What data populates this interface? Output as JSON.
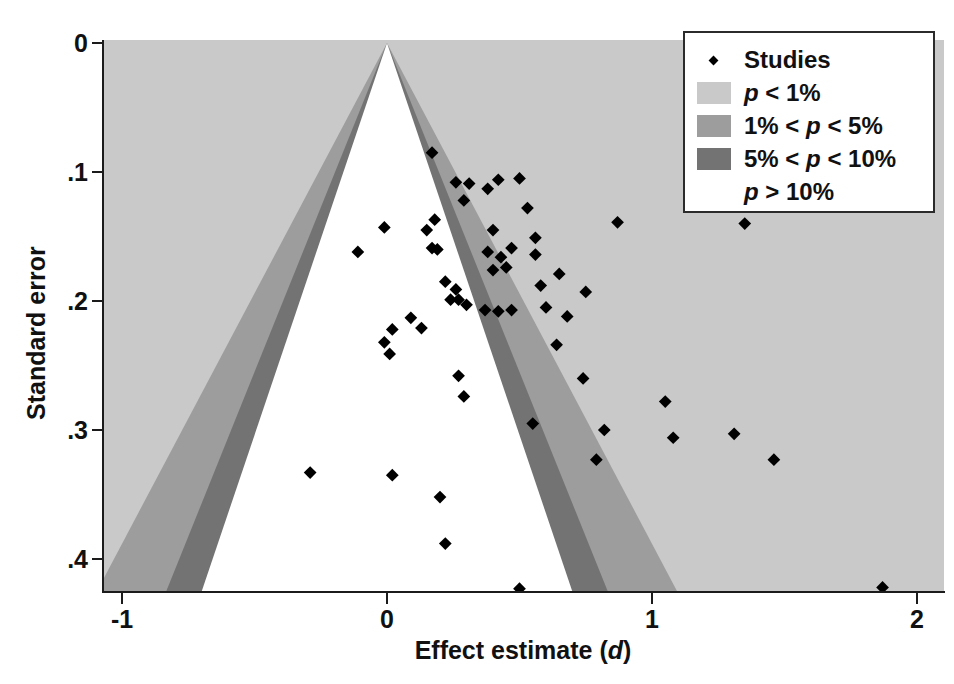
{
  "figure": {
    "type": "funnel-plot",
    "background": "#ffffff"
  },
  "axes": {
    "x": {
      "label_plain": "Effect estimate (d)",
      "label_prefix": "Effect estimate (",
      "label_italic": "d",
      "label_suffix": ")",
      "ticks": [
        "-1",
        "0",
        "1",
        "2"
      ],
      "tick_values": [
        -1,
        0,
        1,
        2
      ],
      "range": [
        -1.07,
        2.1
      ]
    },
    "y": {
      "label": "Standard error",
      "ticks": [
        "0",
        ".1",
        ".2",
        ".3",
        ".4"
      ],
      "tick_values": [
        0,
        0.1,
        0.2,
        0.3,
        0.4
      ],
      "range": [
        0.425,
        0
      ]
    }
  },
  "legend": {
    "position": "top-right",
    "items": [
      {
        "key": "marker",
        "label": "Studies",
        "color": "#000000",
        "label_parts": [
          {
            "text": "Studies",
            "italic": false
          }
        ]
      },
      {
        "key": "swatch",
        "color": "#c9c9c9",
        "label_parts": [
          {
            "text": "p",
            "italic": true
          },
          {
            "text": " < 1%",
            "italic": false
          }
        ]
      },
      {
        "key": "swatch",
        "color": "#9d9d9d",
        "label_parts": [
          {
            "text": "1% < ",
            "italic": false
          },
          {
            "text": "p",
            "italic": true
          },
          {
            "text": " < 5%",
            "italic": false
          }
        ]
      },
      {
        "key": "swatch",
        "color": "#737373",
        "label_parts": [
          {
            "text": "5% < ",
            "italic": false
          },
          {
            "text": "p",
            "italic": true
          },
          {
            "text": " < 10%",
            "italic": false
          }
        ]
      },
      {
        "key": "none",
        "color": "#ffffff",
        "label_parts": [
          {
            "text": "p",
            "italic": true
          },
          {
            "text": " > 10%",
            "italic": false
          }
        ]
      }
    ]
  },
  "chart_data": {
    "type": "scatter",
    "title": "",
    "xlabel": "Effect estimate (d)",
    "ylabel": "Standard error",
    "xlim": [
      -1.07,
      2.1
    ],
    "ylim": [
      0.425,
      0
    ],
    "grid": false,
    "legend_position": "top-right",
    "regions": {
      "description": "Contour-enhanced funnel plot significance regions centred on effect = 0",
      "apex": {
        "x": 0.0,
        "y": 0.0
      },
      "boundaries": [
        {
          "name": "p > 10%",
          "z": 1.645,
          "color": "#ffffff"
        },
        {
          "name": "5% < p < 10%",
          "z": 1.96,
          "color": "#737373"
        },
        {
          "name": "1% < p < 5%",
          "z": 2.576,
          "color": "#9d9d9d"
        },
        {
          "name": "p < 1%",
          "z": null,
          "color": "#c9c9c9"
        }
      ]
    },
    "marker": {
      "shape": "diamond",
      "color": "#000000",
      "size_px": 9
    },
    "points": [
      {
        "x": 0.17,
        "y": 0.085
      },
      {
        "x": 0.26,
        "y": 0.108
      },
      {
        "x": 0.31,
        "y": 0.109
      },
      {
        "x": 0.38,
        "y": 0.113
      },
      {
        "x": 0.42,
        "y": 0.106
      },
      {
        "x": 0.5,
        "y": 0.105
      },
      {
        "x": 0.29,
        "y": 0.122
      },
      {
        "x": 0.53,
        "y": 0.128
      },
      {
        "x": 0.87,
        "y": 0.139
      },
      {
        "x": 1.35,
        "y": 0.14
      },
      {
        "x": -0.01,
        "y": 0.143
      },
      {
        "x": -0.11,
        "y": 0.162
      },
      {
        "x": 0.18,
        "y": 0.137
      },
      {
        "x": 0.15,
        "y": 0.145
      },
      {
        "x": 0.4,
        "y": 0.145
      },
      {
        "x": 0.56,
        "y": 0.151
      },
      {
        "x": 0.17,
        "y": 0.159
      },
      {
        "x": 0.19,
        "y": 0.16
      },
      {
        "x": 0.38,
        "y": 0.162
      },
      {
        "x": 0.43,
        "y": 0.166
      },
      {
        "x": 0.47,
        "y": 0.159
      },
      {
        "x": 0.56,
        "y": 0.164
      },
      {
        "x": 0.45,
        "y": 0.174
      },
      {
        "x": 0.4,
        "y": 0.176
      },
      {
        "x": 0.65,
        "y": 0.179
      },
      {
        "x": 0.58,
        "y": 0.188
      },
      {
        "x": 0.75,
        "y": 0.193
      },
      {
        "x": 0.22,
        "y": 0.185
      },
      {
        "x": 0.26,
        "y": 0.191
      },
      {
        "x": 0.27,
        "y": 0.199
      },
      {
        "x": 0.24,
        "y": 0.199
      },
      {
        "x": 0.3,
        "y": 0.203
      },
      {
        "x": 0.37,
        "y": 0.207
      },
      {
        "x": 0.42,
        "y": 0.208
      },
      {
        "x": 0.47,
        "y": 0.207
      },
      {
        "x": 0.6,
        "y": 0.205
      },
      {
        "x": 0.68,
        "y": 0.212
      },
      {
        "x": 0.09,
        "y": 0.213
      },
      {
        "x": 0.13,
        "y": 0.221
      },
      {
        "x": 0.02,
        "y": 0.222
      },
      {
        "x": -0.01,
        "y": 0.232
      },
      {
        "x": 0.01,
        "y": 0.241
      },
      {
        "x": 0.64,
        "y": 0.234
      },
      {
        "x": 0.27,
        "y": 0.258
      },
      {
        "x": 0.29,
        "y": 0.274
      },
      {
        "x": 0.74,
        "y": 0.26
      },
      {
        "x": 0.55,
        "y": 0.295
      },
      {
        "x": 1.05,
        "y": 0.278
      },
      {
        "x": 0.82,
        "y": 0.3
      },
      {
        "x": 1.31,
        "y": 0.303
      },
      {
        "x": 1.08,
        "y": 0.306
      },
      {
        "x": 1.46,
        "y": 0.323
      },
      {
        "x": 0.79,
        "y": 0.323
      },
      {
        "x": -0.29,
        "y": 0.333
      },
      {
        "x": 0.02,
        "y": 0.335
      },
      {
        "x": 0.2,
        "y": 0.352
      },
      {
        "x": 0.22,
        "y": 0.388
      },
      {
        "x": 0.5,
        "y": 0.423
      },
      {
        "x": 1.87,
        "y": 0.422
      }
    ]
  },
  "geometry": {
    "plot": {
      "left": 103,
      "top": 40,
      "right": 944,
      "bottom": 592
    },
    "x_origin_px": 387,
    "x_unit_px": 265,
    "y_origin_px": 43,
    "y_unit_px": 1290
  }
}
